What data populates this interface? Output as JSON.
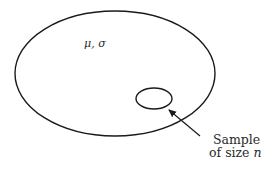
{
  "diagram": {
    "population": {
      "label": "μ, σ",
      "cx": 115,
      "cy": 73.5,
      "rx": 100,
      "ry": 62.5
    },
    "sample": {
      "cx": 154,
      "cy": 98.5,
      "rx": 18,
      "ry": 10.5
    },
    "arrow": {
      "x1": 200,
      "y1": 136,
      "x2": 169,
      "y2": 110
    },
    "sample_label": {
      "line1": "Sample",
      "line2_prefix": "of size ",
      "line2_var": "n"
    },
    "colors": {
      "stroke": "#1a1a1a",
      "text": "#2a2a2a",
      "background": "#ffffff"
    }
  }
}
